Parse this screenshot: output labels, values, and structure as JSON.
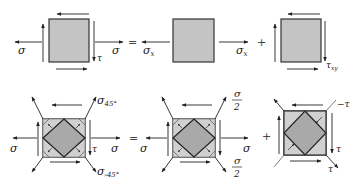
{
  "colors": {
    "square_fill": "#c4c4c4",
    "diamond_fill": "#a9a9a9",
    "triangle_fill": "#d0d0d0",
    "stroke": "#333333",
    "background": "#ffffff"
  },
  "top_row": {
    "element1": {
      "label_left": "σ",
      "label_right": "σ",
      "label_shear": "τ"
    },
    "operator1": "=",
    "element2": {
      "label_left": "σ",
      "label_left_sub": "x",
      "label_right": "σ",
      "label_right_sub": "x"
    },
    "operator2": "+",
    "element3": {
      "label_shear": "τ",
      "label_shear_sub": "xy"
    }
  },
  "bottom_row": {
    "element1": {
      "label_left": "σ",
      "label_right": "σ",
      "label_shear": "τ",
      "label_top_right": "σ",
      "label_top_right_sub": "45°",
      "label_bottom_right": "σ",
      "label_bottom_right_sub": "-45°"
    },
    "operator1": "=",
    "element2": {
      "label_left": "σ",
      "label_right": "σ",
      "label_top_right_num": "σ",
      "label_top_right_den": "2",
      "label_bottom_right_num": "σ",
      "label_bottom_right_den": "2"
    },
    "operator2": "+",
    "element3": {
      "label_top_right": "−τ",
      "label_shear": "τ",
      "label_bottom_right": "τ"
    }
  }
}
